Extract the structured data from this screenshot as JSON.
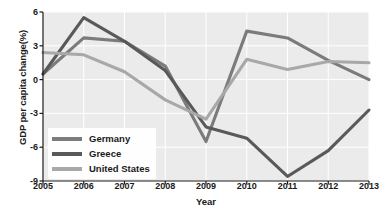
{
  "chart_data": {
    "type": "line",
    "title": "",
    "xlabel": "Year",
    "ylabel": "GDP per capita change(%)",
    "x": [
      2005,
      2006,
      2007,
      2008,
      2009,
      2010,
      2011,
      2012,
      2013
    ],
    "xtick_labels": [
      "2005",
      "2006",
      "2007",
      "2008",
      "2009",
      "2010",
      "2011",
      "2012",
      "2013"
    ],
    "ytick_labels": [
      "6",
      "3",
      "0",
      "-3",
      "-6",
      "-9"
    ],
    "yticks": [
      6,
      3,
      0,
      -3,
      -6,
      -9
    ],
    "xlim": [
      2005,
      2013
    ],
    "ylim": [
      -9,
      6
    ],
    "grid": true,
    "legend_position": "lower-left",
    "plot_background": "#ebebeb",
    "grid_color": "#ffffff",
    "series": [
      {
        "name": "Germany",
        "color": "#7b7b7b",
        "values": [
          0.5,
          3.7,
          3.4,
          1.2,
          -5.5,
          4.3,
          3.7,
          1.7,
          0.0
        ]
      },
      {
        "name": "Greece",
        "color": "#595959",
        "values": [
          0.5,
          5.5,
          3.4,
          0.8,
          -4.2,
          -5.2,
          -8.6,
          -6.3,
          -2.7
        ]
      },
      {
        "name": "United States",
        "color": "#a8a8a8",
        "values": [
          2.4,
          2.2,
          0.7,
          -1.8,
          -3.5,
          1.8,
          0.9,
          1.6,
          1.5
        ]
      }
    ]
  },
  "axis": {
    "y_title": "GDP per capita change(%)",
    "x_title": "Year"
  },
  "legend": {
    "entries": [
      {
        "label": "Germany",
        "color": "#7b7b7b"
      },
      {
        "label": "Greece",
        "color": "#595959"
      },
      {
        "label": "United States",
        "color": "#a8a8a8"
      }
    ]
  }
}
